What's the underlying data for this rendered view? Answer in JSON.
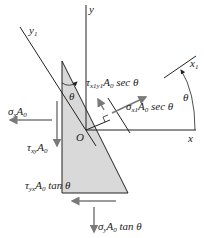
{
  "diagram": {
    "type": "free-body diagram of wedge element (stress transformation)",
    "colors": {
      "element_fill": "#d9d9d9",
      "line": "#222222",
      "arrow": "#7a7a7a",
      "background": "#ffffff"
    },
    "axes": {
      "y_label": "y",
      "x_label": "x",
      "y1_label": "y",
      "y1_sub": "1",
      "x1_label": "x",
      "x1_sub": "1",
      "origin_label": "O"
    },
    "angles": {
      "theta_top": "θ",
      "theta_right": "θ"
    },
    "forces": {
      "sigma_x": {
        "sym": "σ",
        "sub": "x",
        "rest": "A",
        "rest_sub": "0",
        "tail": ""
      },
      "tau_xy": {
        "sym": "τ",
        "sub": "xy",
        "rest": "A",
        "rest_sub": "0",
        "tail": ""
      },
      "tau_x1y1": {
        "sym": "τ",
        "sub": "x1y1",
        "rest": "A",
        "rest_sub": "0",
        "tail": " sec θ"
      },
      "sigma_x1": {
        "sym": "σ",
        "sub": "x1",
        "rest": "A",
        "rest_sub": "0",
        "tail": " sec θ"
      },
      "tau_yx": {
        "sym": "τ",
        "sub": "yx",
        "rest": "A",
        "rest_sub": "0",
        "tail": " tan θ"
      },
      "sigma_y": {
        "sym": "σ",
        "sub": "y",
        "rest": "A",
        "rest_sub": "0",
        "tail": " tan θ"
      }
    }
  }
}
